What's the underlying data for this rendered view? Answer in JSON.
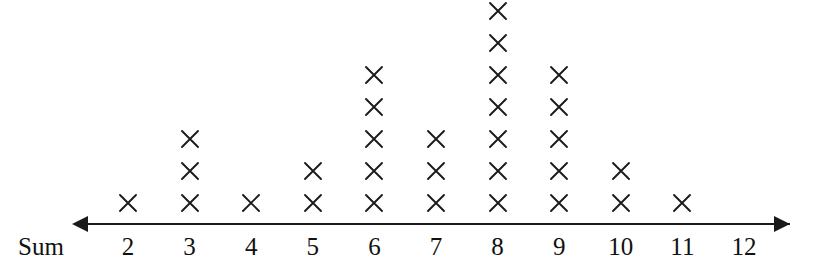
{
  "axis": {
    "caption": "Sum",
    "left_arrow_icon": "arrow-left-icon",
    "right_arrow_icon": "arrow-right-icon",
    "tick_labels": [
      "2",
      "3",
      "4",
      "5",
      "6",
      "7",
      "8",
      "9",
      "10",
      "11",
      "12"
    ],
    "line_color": "#1a1a1a"
  },
  "marks": {
    "glyph": "x-mark-icon",
    "color": "#1a1a1a"
  },
  "chart_data": {
    "type": "bar",
    "plot_style": "dot-plot-x-marks",
    "title": "",
    "subtitle": "",
    "xlabel": "Sum",
    "ylabel": "",
    "categories": [
      "2",
      "3",
      "4",
      "5",
      "6",
      "7",
      "8",
      "9",
      "10",
      "11",
      "12"
    ],
    "values": [
      1,
      3,
      1,
      2,
      5,
      3,
      7,
      5,
      2,
      1,
      0
    ],
    "total_count": 30,
    "xlim": [
      2,
      12
    ],
    "ylim": [
      0,
      7
    ],
    "grid": false,
    "legend": null,
    "annotations": [],
    "tick_labels": [
      "2",
      "3",
      "4",
      "5",
      "6",
      "7",
      "8",
      "9",
      "10",
      "11",
      "12"
    ],
    "axis_arrows": [
      "left",
      "right"
    ],
    "mark_symbol": "×",
    "layout": {
      "baseline_y": 203,
      "row_spacing": 32,
      "column_spacing": 61.6,
      "first_column_x": 128
    }
  }
}
